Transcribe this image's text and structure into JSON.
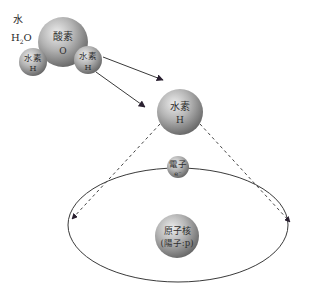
{
  "water": {
    "label": "水",
    "formula_main": "H",
    "formula_sub": "2",
    "formula_end": "O"
  },
  "oxygen": {
    "name": "酸素",
    "symbol": "O"
  },
  "hydrogen_left": {
    "name": "水素",
    "symbol": "H"
  },
  "hydrogen_right": {
    "name": "水素",
    "symbol": "H"
  },
  "hydrogen_atom": {
    "name": "水素",
    "symbol": "H"
  },
  "electron": {
    "name": "電子",
    "symbol": "e⁻"
  },
  "nucleus": {
    "name": "原子核",
    "detail": "(陽子:p)"
  },
  "colors": {
    "sphere_light": "#e6e6e6",
    "sphere_dark": "#6a6a6a",
    "line": "#3a3a3a",
    "arrowhead": "#2a2030"
  }
}
